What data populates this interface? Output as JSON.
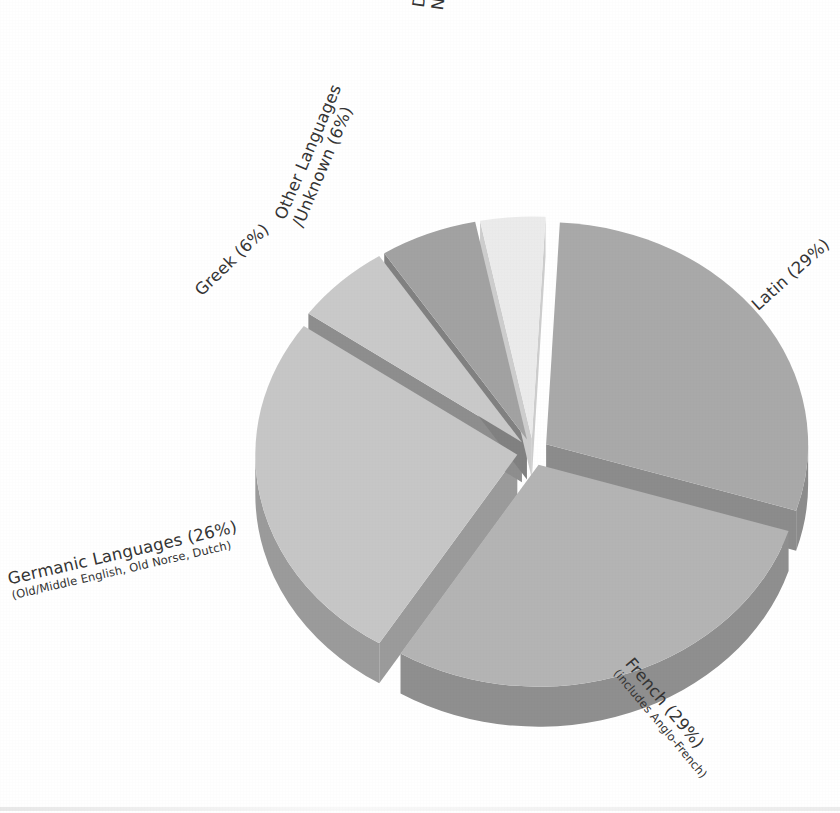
{
  "chart_data": {
    "type": "pie",
    "title": "",
    "subtitle": "",
    "style": "3d-exploded",
    "legend_position": "none",
    "labels_outside": true,
    "total_percent": 100,
    "categories": [
      "Latin",
      "French (includes Anglo-French)",
      "Germanic Languages (Old/Middle English, Old Norse, Dutch)",
      "Greek",
      "Other Languages /Unknown",
      "Derived from Proper Names"
    ],
    "values": [
      29,
      29,
      26,
      6,
      6,
      4
    ],
    "slices": [
      {
        "key": "latin",
        "name": "Latin",
        "sub": "",
        "value": 29,
        "label": "Latin (29%)",
        "color": "#a9a9a9",
        "side_color": "#8c8c8c",
        "start_angle": 3,
        "end_angle": 107.4
      },
      {
        "key": "french",
        "name": "French",
        "sub": "(includes Anglo-French)",
        "value": 29,
        "label": "French (29%)",
        "color": "#b4b4b4",
        "side_color": "#8f8f8f",
        "start_angle": 107.4,
        "end_angle": 211.8
      },
      {
        "key": "germanic",
        "name": "Germanic Languages",
        "sub": "(Old/Middle English, Old Norse, Dutch)",
        "value": 26,
        "label": "Germanic Languages (26%)",
        "color": "#c6c6c6",
        "side_color": "#9b9b9b",
        "start_angle": 211.8,
        "end_angle": 305.4
      },
      {
        "key": "greek",
        "name": "Greek",
        "sub": "",
        "value": 6,
        "label": "Greek (6%)",
        "color": "#c9c9c9",
        "side_color": "#8e8e8e",
        "start_angle": 305.4,
        "end_angle": 327.0
      },
      {
        "key": "other",
        "name": "Other Languages /Unknown",
        "sub": "",
        "value": 6,
        "label": "Other Languages /Unknown (6%)",
        "color": "#a2a2a2",
        "side_color": "#818181",
        "start_angle": 327.0,
        "end_angle": 348.6
      },
      {
        "key": "proper",
        "name": "Derived from Proper Names",
        "sub": "",
        "value": 4,
        "label": "Derived from Proper Names (4%)",
        "color": "#ebebeb",
        "side_color": "#cdcdcd",
        "start_angle": 348.6,
        "end_angle": 363.0
      }
    ]
  },
  "labels": {
    "latin": {
      "main": "Latin (29%)",
      "sub": ""
    },
    "french": {
      "main": "French (29%)",
      "sub": "(includes Anglo-French)"
    },
    "germanic": {
      "main": "Germanic Languages (26%)",
      "sub": "(Old/Middle English, Old Norse, Dutch)"
    },
    "greek": {
      "main": "Greek (6%)",
      "sub": ""
    },
    "other": {
      "main": "Other Languages",
      "sub": "/Unknown (6%)"
    },
    "proper": {
      "main": "Derived from Proper",
      "sub": "Names (4%)"
    }
  },
  "colors": {
    "background": "#ffffff",
    "text": "#343434",
    "latin_top": "#a9a9a9",
    "french_top": "#b4b4b4",
    "germanic_top": "#c6c6c6",
    "greek_top": "#c9c9c9",
    "other_top": "#a2a2a2",
    "proper_top": "#ebebeb"
  }
}
